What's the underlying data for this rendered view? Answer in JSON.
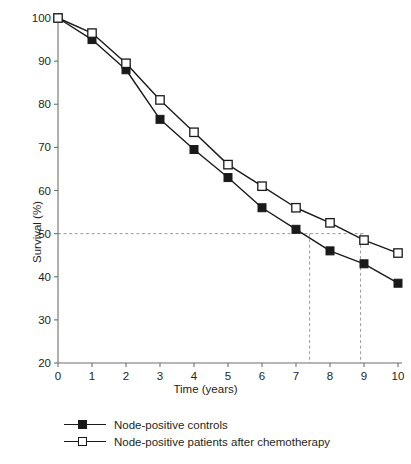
{
  "chart_data": {
    "type": "line",
    "title": "",
    "xlabel": "Time (years)",
    "ylabel": "Survival (%)",
    "x": [
      0,
      1,
      2,
      3,
      4,
      5,
      6,
      7,
      8,
      9,
      10
    ],
    "xlim": [
      0,
      10
    ],
    "ylim": [
      20,
      100
    ],
    "xticks": [
      "0",
      "1",
      "2",
      "3",
      "4",
      "5",
      "6",
      "7",
      "8",
      "9",
      "10"
    ],
    "yticks": [
      "20",
      "30",
      "40",
      "50",
      "60",
      "70",
      "80",
      "90",
      "100"
    ],
    "grid": false,
    "legend_position": "below-plot",
    "series": [
      {
        "name": "Node-positive controls",
        "marker": "filled-square",
        "color": "#1a1a1a",
        "values": [
          100,
          95,
          88,
          76.5,
          69.5,
          63,
          56,
          51,
          46,
          43,
          38.5
        ]
      },
      {
        "name": "Node-positive patients after chemotherapy",
        "marker": "open-square",
        "color": "#1a1a1a",
        "values": [
          100,
          96.5,
          89.5,
          81,
          73.5,
          66,
          61,
          56,
          52.5,
          48.5,
          45.5
        ]
      }
    ],
    "reference_lines": [
      {
        "name": "median-survival-horizontal",
        "orientation": "horizontal",
        "value": 50,
        "style": "dashed",
        "color": "#9a9a9a"
      },
      {
        "name": "median-survival-controls",
        "orientation": "vertical",
        "value": 7.4,
        "style": "dashed",
        "color": "#9a9a9a"
      },
      {
        "name": "median-survival-chemotherapy",
        "orientation": "vertical",
        "value": 8.9,
        "style": "dashed",
        "color": "#9a9a9a"
      }
    ]
  },
  "legend": {
    "items": [
      {
        "label": "Node-positive controls",
        "marker": "filled-square"
      },
      {
        "label": "Node-positive patients after chemotherapy",
        "marker": "open-square"
      }
    ]
  },
  "axes": {
    "y_title": "Survival (%)",
    "x_title": "Time (years)"
  }
}
